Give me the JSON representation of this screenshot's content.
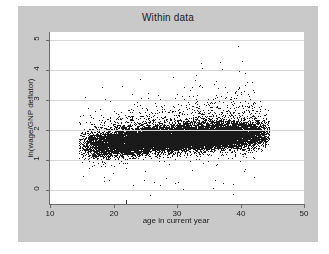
{
  "figure": {
    "background_color": "#ffffff",
    "panel_color": "#c9c9c9",
    "plot_background": "#ffffff",
    "axis_color": "#6b6b6b",
    "grid_color": "#d7d7d7",
    "marker_color": "#1a1a1a"
  },
  "chart_data": {
    "type": "scatter",
    "title": "Within data",
    "xlabel": "age in current year",
    "ylabel": "ln(wage/GNP deflator)",
    "xlim": [
      10,
      50
    ],
    "ylim": [
      -0.45,
      5.25
    ],
    "xticks": [
      10,
      20,
      30,
      40,
      50
    ],
    "xtick_labels": [
      "10",
      "20",
      "30",
      "40",
      "50"
    ],
    "yticks": [
      0,
      1,
      2,
      3,
      4,
      5
    ],
    "ytick_labels": [
      "0",
      "1",
      "2",
      "3",
      "4",
      "5"
    ],
    "grid": "horizontal",
    "legend": "none",
    "n_points": 19000,
    "marker_size_px": 1,
    "cloud": {
      "x_range": [
        14.5,
        44.5
      ],
      "core_x_range": [
        18.5,
        43.5
      ],
      "core_y_range": [
        1.3,
        2.1
      ],
      "y_range": [
        -0.2,
        4.85
      ],
      "y_center_at_x": [
        {
          "x": 16,
          "y": 1.5
        },
        {
          "x": 20,
          "y": 1.58
        },
        {
          "x": 24,
          "y": 1.65
        },
        {
          "x": 28,
          "y": 1.7
        },
        {
          "x": 32,
          "y": 1.76
        },
        {
          "x": 36,
          "y": 1.8
        },
        {
          "x": 40,
          "y": 1.84
        },
        {
          "x": 44,
          "y": 1.86
        }
      ],
      "spread_at_x": [
        {
          "x": 16,
          "sd": 0.34
        },
        {
          "x": 20,
          "sd": 0.3
        },
        {
          "x": 26,
          "sd": 0.27
        },
        {
          "x": 32,
          "sd": 0.28
        },
        {
          "x": 38,
          "sd": 0.3
        },
        {
          "x": 44,
          "sd": 0.31
        }
      ],
      "density_at_x": [
        {
          "x": 15,
          "weight": 0.1
        },
        {
          "x": 18,
          "weight": 0.45
        },
        {
          "x": 22,
          "weight": 0.85
        },
        {
          "x": 26,
          "weight": 1.0
        },
        {
          "x": 30,
          "weight": 1.0
        },
        {
          "x": 34,
          "weight": 0.95
        },
        {
          "x": 38,
          "weight": 0.85
        },
        {
          "x": 42,
          "weight": 0.55
        },
        {
          "x": 44,
          "weight": 0.15
        }
      ]
    },
    "notable_outliers": [
      {
        "x": 39.6,
        "y": 4.8
      },
      {
        "x": 40.2,
        "y": 4.28
      },
      {
        "x": 33.8,
        "y": 4.22
      },
      {
        "x": 34.0,
        "y": 4.05
      },
      {
        "x": 27.6,
        "y": 3.98
      },
      {
        "x": 39.8,
        "y": 3.96
      },
      {
        "x": 41.0,
        "y": 3.6
      },
      {
        "x": 24.2,
        "y": 3.68
      },
      {
        "x": 36.2,
        "y": 3.62
      },
      {
        "x": 21.4,
        "y": 3.45
      },
      {
        "x": 25.8,
        "y": -0.15
      },
      {
        "x": 38.8,
        "y": -0.12
      },
      {
        "x": 31.0,
        "y": 0.05
      },
      {
        "x": 35.6,
        "y": 0.08
      },
      {
        "x": 23.0,
        "y": 0.18
      }
    ],
    "low_tick_marker": {
      "x": 22.0,
      "y": -0.32,
      "note": "small vertical tick below axis band"
    }
  }
}
